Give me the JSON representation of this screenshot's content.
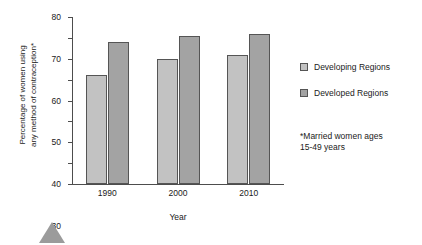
{
  "chart_data": {
    "type": "bar",
    "title": "",
    "subtitle": "",
    "categories": [
      "1990",
      "2000",
      "2010"
    ],
    "series": [
      {
        "name": "Developing Regions",
        "values": [
          52,
          60,
          62
        ],
        "color": "#c2c2c2"
      },
      {
        "name": "Developed Regions",
        "values": [
          68,
          71,
          72
        ],
        "color": "#a3a3a3"
      }
    ],
    "xlabel": "Year",
    "ylabel": "Percentage of women using\nany method of contraception*",
    "ylim": [
      0,
      80
    ],
    "yticks": [
      0,
      10,
      20,
      30,
      40,
      50,
      60,
      70,
      80
    ],
    "ytick_labels": [
      "0",
      "10",
      "20",
      "30",
      "40",
      "50",
      "60",
      "70",
      "80"
    ],
    "grid": false,
    "legend_position": "right",
    "annotations": [
      "*Married women ages\n15-49 years"
    ]
  },
  "axes": {
    "y_title": "Percentage of women using\nany method of contraception*",
    "x_title": "Year"
  },
  "legend": {
    "items": [
      {
        "label": "Developing Regions",
        "swatch": "#c2c2c2"
      },
      {
        "label": "Developed Regions",
        "swatch": "#a3a3a3"
      }
    ]
  },
  "footnote": {
    "text": "*Married women ages\n15-49 years"
  },
  "decoration": {
    "marker": "triangle-up-icon",
    "marker_color": "#9b9b9b"
  }
}
